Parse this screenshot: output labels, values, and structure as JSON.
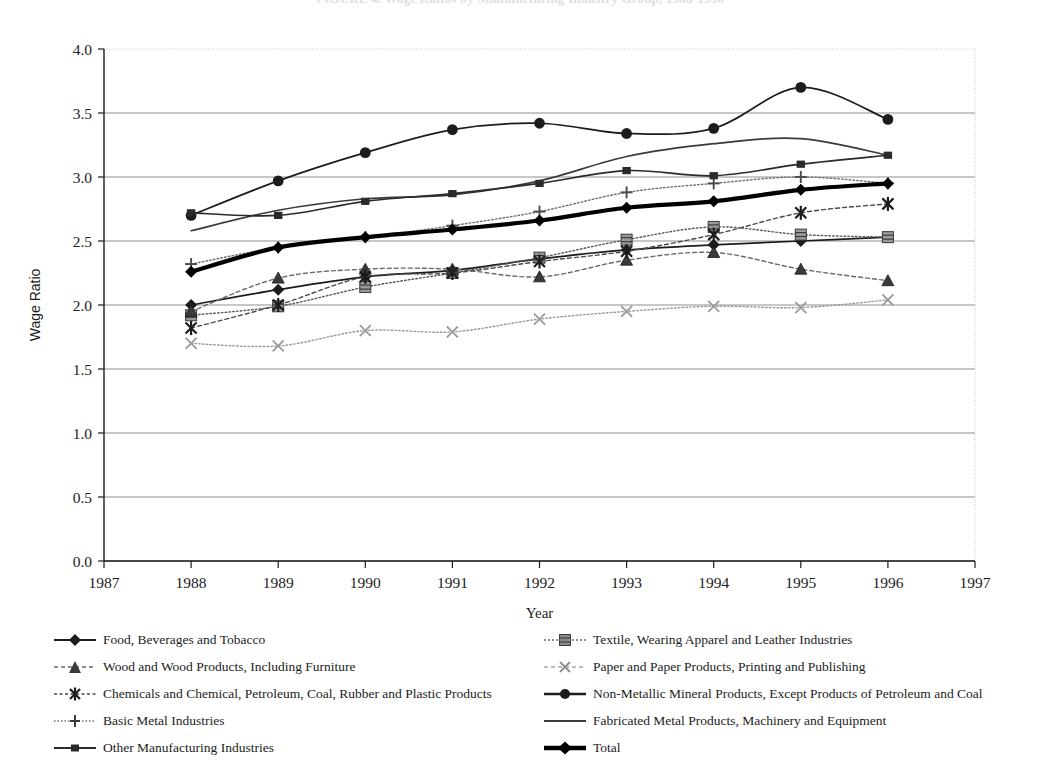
{
  "title": "FIGURE 4. Wage Ratios by Manufacturing Industry Group, 1988-1996",
  "axes": {
    "y_label": "Wage Ratio",
    "x_label": "Year",
    "y_ticks": [
      "0.0",
      "0.5",
      "1.0",
      "1.5",
      "2.0",
      "2.5",
      "3.0",
      "3.5",
      "4.0"
    ],
    "x_ticks": [
      "1987",
      "1988",
      "1989",
      "1990",
      "1991",
      "1992",
      "1993",
      "1994",
      "1995",
      "1996",
      "1997"
    ]
  },
  "chart_data": {
    "type": "line",
    "title": "FIGURE 4. Wage Ratios by Manufacturing Industry Group, 1988-1996",
    "xlabel": "Year",
    "ylabel": "Wage Ratio",
    "xlim": [
      1987,
      1997
    ],
    "ylim": [
      0.0,
      4.0
    ],
    "grid": "horizontal",
    "legend_position": "bottom",
    "x": [
      1988,
      1989,
      1990,
      1991,
      1992,
      1993,
      1994,
      1995,
      1996
    ],
    "series": [
      {
        "name": "Food, Beverages and Tobacco",
        "marker": "diamond-filled",
        "line": "solid",
        "color": "#1c1c1c",
        "values": [
          2.0,
          2.12,
          2.22,
          2.27,
          2.36,
          2.43,
          2.47,
          2.5,
          2.53
        ]
      },
      {
        "name": "Textile, Wearing Apparel and Leather Industries",
        "marker": "square-hatched",
        "line": "dotted",
        "color": "#5a5a5a",
        "values": [
          1.92,
          1.99,
          2.14,
          2.25,
          2.37,
          2.51,
          2.61,
          2.55,
          2.53
        ]
      },
      {
        "name": "Wood and Wood Products, Including Furniture",
        "marker": "triangle",
        "line": "dashed",
        "color": "#6a6a6a",
        "values": [
          1.95,
          2.21,
          2.28,
          2.28,
          2.22,
          2.35,
          2.41,
          2.28,
          2.19
        ]
      },
      {
        "name": "Paper and Paper Products, Printing and Publishing",
        "marker": "cross-x",
        "line": "dotted",
        "color": "#9a9a9a",
        "values": [
          1.7,
          1.68,
          1.8,
          1.79,
          1.89,
          1.95,
          1.99,
          1.98,
          2.04
        ]
      },
      {
        "name": "Chemicals and Chemical, Petroleum, Coal, Rubber and Plastic Products",
        "marker": "star-x",
        "line": "dashed",
        "color": "#4a4a4a",
        "values": [
          1.82,
          2.0,
          2.22,
          2.25,
          2.34,
          2.42,
          2.55,
          2.72,
          2.79
        ]
      },
      {
        "name": "Non-Metallic Mineral Products, Except Products of Petroleum and Coal",
        "marker": "circle-filled",
        "line": "solid",
        "color": "#1c1c1c",
        "values": [
          2.7,
          2.97,
          3.19,
          3.37,
          3.42,
          3.34,
          3.38,
          3.7,
          3.45
        ]
      },
      {
        "name": "Basic Metal Industries",
        "marker": "plus",
        "line": "dotted",
        "color": "#707070",
        "values": [
          2.32,
          2.45,
          2.53,
          2.62,
          2.73,
          2.88,
          2.95,
          3.0,
          2.95
        ]
      },
      {
        "name": "Fabricated Metal Products, Machinery and Equipment",
        "marker": "none",
        "line": "solid",
        "color": "#3a3a3a",
        "values": [
          2.58,
          2.74,
          2.83,
          2.86,
          2.97,
          3.16,
          3.26,
          3.3,
          3.17
        ]
      },
      {
        "name": "Other Manufacturing Industries",
        "marker": "square-small",
        "line": "solid",
        "color": "#2a2a2a",
        "values": [
          2.72,
          2.7,
          2.81,
          2.87,
          2.95,
          3.05,
          3.01,
          3.1,
          3.17
        ]
      },
      {
        "name": "Total",
        "marker": "diamond-filled",
        "line": "solid-thick",
        "color": "#000000",
        "values": [
          2.26,
          2.45,
          2.53,
          2.59,
          2.66,
          2.76,
          2.81,
          2.9,
          2.95
        ]
      }
    ]
  },
  "legend": {
    "left": [
      "Food, Beverages and Tobacco",
      "Wood and Wood Products, Including Furniture",
      "Chemicals and Chemical, Petroleum, Coal, Rubber and Plastic Products",
      "Basic Metal Industries",
      "Other Manufacturing Industries"
    ],
    "right": [
      "Textile, Wearing Apparel and Leather Industries",
      "Paper and Paper Products, Printing and Publishing",
      "Non-Metallic Mineral Products, Except Products of Petroleum and Coal",
      "Fabricated Metal Products, Machinery and Equipment",
      "Total"
    ]
  }
}
